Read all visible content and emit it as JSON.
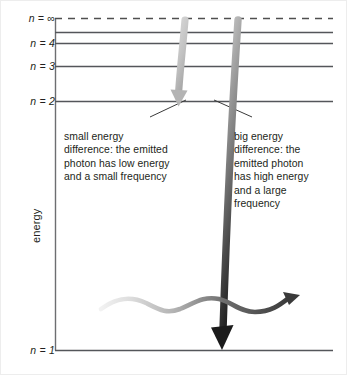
{
  "figure": {
    "axis": {
      "y_label": "energy"
    },
    "energy_levels": [
      {
        "id": "n-infinity",
        "label": "n = ∞",
        "style": "dashed",
        "y": 18
      },
      {
        "id": "n-5",
        "label": "",
        "style": "solid",
        "y": 32
      },
      {
        "id": "n-4",
        "label": "n = 4",
        "style": "solid",
        "y": 43
      },
      {
        "id": "n-3",
        "label": "n = 3",
        "style": "solid",
        "y": 66
      },
      {
        "id": "n-2",
        "label": "n = 2",
        "style": "solid",
        "y": 101
      },
      {
        "id": "n-1",
        "label": "n = 1",
        "style": "solid",
        "y": 350
      }
    ],
    "callouts": [
      {
        "id": "small-energy",
        "lines": [
          "small energy",
          "difference: the emitted",
          "photon has low energy",
          "and a small frequency"
        ]
      },
      {
        "id": "big-energy",
        "lines": [
          "big energy",
          "difference: the",
          "emitted photon",
          "has high energy",
          "and a large",
          "frequency"
        ]
      }
    ],
    "transitions": [
      {
        "id": "short-transition",
        "description": "electron falls from n = ∞ to n = 2",
        "from_level": "n-infinity",
        "to_level": "n-2"
      },
      {
        "id": "long-transition",
        "description": "electron falls from n = ∞ to n = 1",
        "from_level": "n-infinity",
        "to_level": "n-1"
      }
    ],
    "photons": [
      {
        "id": "low-energy-photon",
        "description": "long wavelength low frequency photon wave",
        "wavelength": "long"
      },
      {
        "id": "high-energy-photon",
        "description": "short wavelength high frequency photon wave",
        "wavelength": "short"
      }
    ],
    "colors": {
      "ink": "#231f20",
      "level_line": "#54565a",
      "axis_line": "#6d6e71",
      "arrow_light": "#c9c9c9",
      "arrow_mid": "#8a8a8a",
      "arrow_dark": "#231f20",
      "wave_light": "#e2e2e2",
      "wave_dark": "#3d3d3d",
      "frame": "#e8e8e8",
      "background": "#ffffff"
    }
  }
}
